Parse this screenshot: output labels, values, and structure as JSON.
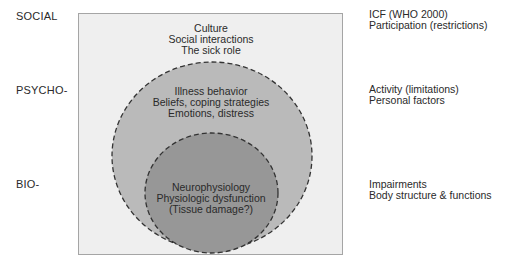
{
  "levels": {
    "social": "SOCIAL",
    "psycho": "PSYCHO-",
    "bio": "BIO-"
  },
  "icf": {
    "social": [
      "ICF (WHO 2000)",
      "Participation (restrictions)"
    ],
    "psycho": [
      "Activity (limitations)",
      "Personal factors"
    ],
    "bio": [
      "Impairments",
      "Body structure & functions"
    ]
  },
  "layers": {
    "social": [
      "Culture",
      "Social interactions",
      "The sick role"
    ],
    "psycho": [
      "Illness behavior",
      "Beliefs, coping strategies",
      "Emotions, distress"
    ],
    "bio": [
      "Neurophysiology",
      "Physiologic dysfunction",
      "(Tissue damage?)"
    ]
  },
  "colors": {
    "box_fill": "#efefef",
    "box_border": "#9a9a9a",
    "outer_circle": "#b9b9b9",
    "inner_circle": "#969696",
    "dash": "#333333"
  }
}
